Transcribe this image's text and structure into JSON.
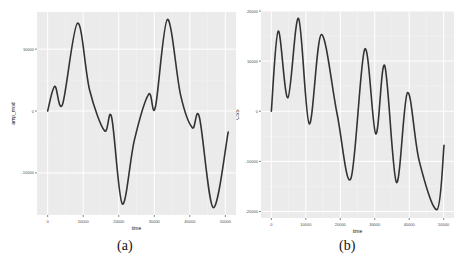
{
  "chart_data": [
    {
      "type": "line",
      "panel_label": "(a)",
      "xlabel": "time",
      "ylabel": "amp_mod",
      "x_ticks": [
        0,
        10000,
        20000,
        30000,
        40000,
        50000
      ],
      "y_ticks": [
        10000,
        0,
        -10000
      ],
      "xlim": [
        -3000,
        53000
      ],
      "ylim": [
        -16800,
        16000
      ],
      "grid": true,
      "style": "ggplot2 grey background, white gridlines",
      "series": [
        {
          "name": "amp_mod",
          "color": "#333333",
          "x": [
            0,
            2000,
            4200,
            8400,
            11800,
            16000,
            18000,
            21000,
            24400,
            28400,
            30300,
            33700,
            37400,
            40700,
            42700,
            46600,
            50800
          ],
          "y": [
            0,
            4000,
            1100,
            14200,
            3400,
            -3200,
            -1000,
            -15000,
            -4700,
            2700,
            600,
            14800,
            2600,
            -2700,
            -1000,
            -15600,
            -3400
          ]
        }
      ]
    },
    {
      "type": "line",
      "panel_label": "(b)",
      "xlabel": "time",
      "ylabel": "CSS",
      "x_ticks": [
        0,
        10000,
        20000,
        30000,
        40000,
        50000
      ],
      "y_ticks": [
        20000,
        10000,
        0,
        -10000,
        -20000
      ],
      "xlim": [
        -3000,
        53000
      ],
      "ylim": [
        -21300,
        20000
      ],
      "grid": true,
      "style": "ggplot2 grey background, white gridlines",
      "series": [
        {
          "name": "CSS",
          "color": "#333333",
          "x": [
            0,
            2000,
            4800,
            7900,
            11000,
            14500,
            19100,
            23100,
            27100,
            30300,
            32900,
            36300,
            39500,
            42900,
            48100,
            50100
          ],
          "y": [
            0,
            16000,
            2700,
            18500,
            -2500,
            15300,
            -600,
            -13400,
            12400,
            -4500,
            9100,
            -14200,
            3700,
            -9900,
            -19600,
            -6800
          ]
        }
      ]
    }
  ],
  "panels": [
    {
      "caption": "(a)",
      "xlabel": "time",
      "ylabel": "amp_mod"
    },
    {
      "caption": "(b)",
      "xlabel": "time",
      "ylabel": "CSS"
    }
  ],
  "colors": {
    "panel_bg": "#ebebeb",
    "grid_major": "#ffffff",
    "line": "#333333",
    "axis_text": "#4d4d4d"
  }
}
